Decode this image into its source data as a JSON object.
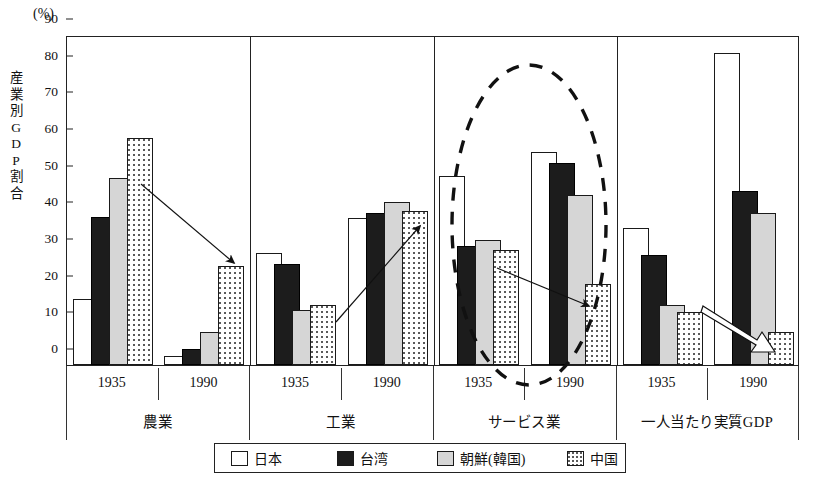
{
  "chart_data": {
    "type": "bar",
    "title": "",
    "unit_label": "(%)",
    "ylabel": "産業別GDP割合",
    "xlabel": "",
    "ylim": [
      0,
      90
    ],
    "yticks": [
      0,
      10,
      20,
      30,
      40,
      50,
      60,
      70,
      80,
      90
    ],
    "grid": false,
    "legend_position": "bottom",
    "legend": [
      "日本",
      "台湾",
      "朝鮮(韓国)",
      "中国"
    ],
    "series": [
      {
        "name": "日本",
        "values": [
          18.0,
          2.5,
          30.5,
          40.0,
          51.5,
          58.0,
          37.5,
          85.0
        ]
      },
      {
        "name": "台湾",
        "values": [
          40.5,
          4.5,
          27.5,
          41.5,
          32.5,
          55.0,
          30.0,
          47.5
        ]
      },
      {
        "name": "朝鮮(韓国)",
        "values": [
          51.0,
          9.0,
          15.0,
          44.5,
          34.0,
          46.5,
          16.5,
          41.5
        ]
      },
      {
        "name": "中国",
        "values": [
          62.0,
          27.0,
          16.5,
          42.0,
          31.5,
          22.0,
          14.5,
          9.0
        ]
      }
    ],
    "categories": [
      "農業 1935",
      "農業 1990",
      "工業 1935",
      "工業 1990",
      "サービス業 1935",
      "サービス業 1990",
      "一人当たり実質GDP 1935",
      "一人当たり実質GDP 1990"
    ],
    "groups": [
      {
        "label": "農業",
        "years": [
          "1935",
          "1990"
        ]
      },
      {
        "label": "工業",
        "years": [
          "1935",
          "1990"
        ]
      },
      {
        "label": "サービス業",
        "years": [
          "1935",
          "1990"
        ]
      },
      {
        "label": "一人当たり実質GDP",
        "years": [
          "1935",
          "1990"
        ]
      }
    ],
    "annotations": [
      {
        "kind": "ellipse-dashed",
        "target": "サービス業"
      },
      {
        "kind": "arrow",
        "from": "農業 1935 中国",
        "to": "農業 1990 中国"
      },
      {
        "kind": "arrow",
        "from": "工業 1935 朝鮮(韓国)",
        "to": "工業 1990 中国"
      },
      {
        "kind": "arrow",
        "from": "サービス業 1935 中国",
        "to": "サービス業 1990 中国"
      },
      {
        "kind": "block-arrow",
        "from": "一人当たり実質GDP 1935 中国",
        "to": "一人当たり実質GDP 1990 中国"
      }
    ],
    "colors": {
      "日本": "#ffffff",
      "台湾": "#1c1c1c",
      "朝鮮(韓国)": "#d6d6d6",
      "中国": "#ffffff",
      "axis": "#222222",
      "annotation": "#111111"
    }
  },
  "yaxis_title_chars": [
    "産",
    "業",
    "別",
    "G",
    "D",
    "P",
    "割",
    "合"
  ]
}
